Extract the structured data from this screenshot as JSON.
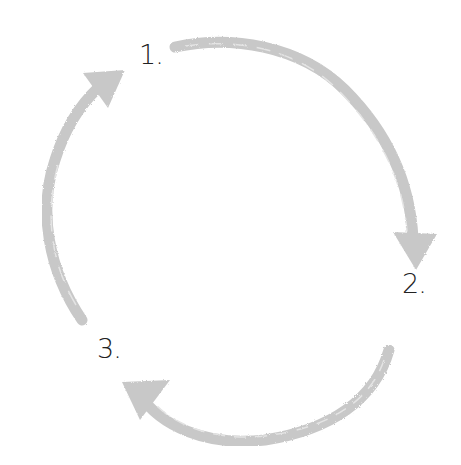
{
  "diagram": {
    "type": "cycle",
    "arrow_color": "#c8c8c8",
    "arrow_highlight": "#e6e6e6",
    "steps": [
      {
        "label": "1."
      },
      {
        "label": "2."
      },
      {
        "label": "3."
      }
    ],
    "arrows": [
      {
        "from": "1.",
        "to": "2.",
        "direction": "clockwise"
      },
      {
        "from": "2.",
        "to": "3.",
        "direction": "clockwise"
      },
      {
        "from": "3.",
        "to": "1.",
        "direction": "clockwise"
      }
    ]
  }
}
